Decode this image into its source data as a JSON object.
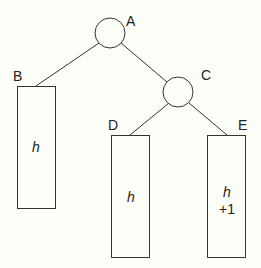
{
  "diagram": {
    "type": "tree",
    "background": "#fefef8",
    "stroke_color": "#333333",
    "nodes": {
      "A": {
        "label": "A",
        "shape": "circle"
      },
      "B": {
        "label": "B",
        "shape": "rectangle",
        "content": [
          "h"
        ]
      },
      "C": {
        "label": "C",
        "shape": "circle"
      },
      "D": {
        "label": "D",
        "shape": "rectangle",
        "content": [
          "h"
        ]
      },
      "E": {
        "label": "E",
        "shape": "rectangle",
        "content": [
          "h",
          "+1"
        ]
      }
    },
    "edges": [
      {
        "from": "A",
        "to": "B"
      },
      {
        "from": "A",
        "to": "C"
      },
      {
        "from": "C",
        "to": "D"
      },
      {
        "from": "C",
        "to": "E"
      }
    ]
  }
}
